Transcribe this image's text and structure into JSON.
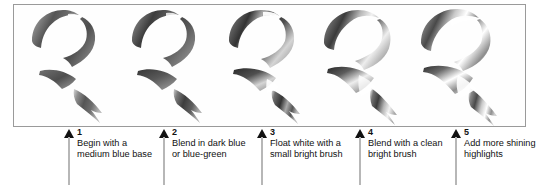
{
  "figure": {
    "kind": "painting-technique-step-sequence",
    "panel": {
      "border_color": "#9a9a9a",
      "background": "#fefefe"
    },
    "ink_color": "#4a4a4a",
    "arrow_color": "#111111",
    "stem_color": "#b7b7b7",
    "text_color": "#111111"
  },
  "steps": [
    {
      "number": "1",
      "text": "Begin with a medium blue base",
      "art_name": "brush-stroke-step-1"
    },
    {
      "number": "2",
      "text": "Blend in dark blue or blue-green",
      "art_name": "brush-stroke-step-2"
    },
    {
      "number": "3",
      "text": "Float white with a small bright brush",
      "art_name": "brush-stroke-step-3"
    },
    {
      "number": "4",
      "text": "Blend with a clean bright brush",
      "art_name": "brush-stroke-step-4"
    },
    {
      "number": "5",
      "text": "Add more shining highlights",
      "art_name": "brush-stroke-step-5"
    }
  ]
}
